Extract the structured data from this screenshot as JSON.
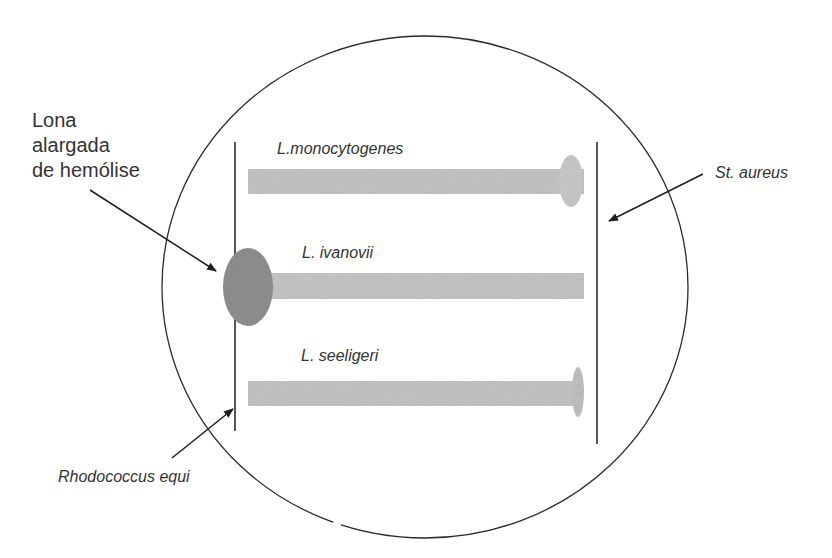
{
  "diagram": {
    "colors": {
      "background": "#ffffff",
      "line": "#2b2b2b",
      "streak": "#c4c4c4",
      "hemolysis_light": "#c9c9c9",
      "hemolysis_dark": "#8e8e8e"
    },
    "labels": {
      "hemolysis_zone": [
        "Lona",
        "alargada",
        "de hemólise"
      ],
      "st_aureus": "St. aureus",
      "rhodococcus": "Rhodococcus equi",
      "l_monocytogenes": "L.monocytogenes",
      "l_ivanovii": "L. ivanovii",
      "l_seeligeri": "L. seeligeri"
    },
    "plate": {
      "shape": "circle"
    },
    "streaks": [
      {
        "name": "L.monocytogenes",
        "hemolysis_side": "St. aureus",
        "hemolysis_size": "small"
      },
      {
        "name": "L. ivanovii",
        "hemolysis_side": "Rhodococcus equi",
        "hemolysis_size": "large"
      },
      {
        "name": "L. seeligeri",
        "hemolysis_side": "St. aureus",
        "hemolysis_size": "very small"
      }
    ],
    "vertical_streaks": [
      {
        "name": "Rhodococcus equi",
        "position": "left"
      },
      {
        "name": "St. aureus",
        "position": "right"
      }
    ]
  }
}
